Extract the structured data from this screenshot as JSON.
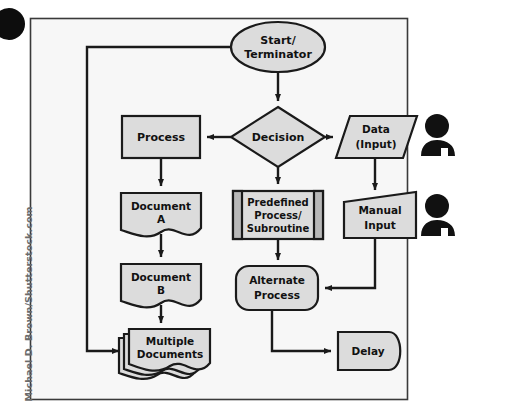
{
  "canvas": {
    "width": 528,
    "height": 417,
    "background": "#ffffff",
    "frame": {
      "x": 30,
      "y": 18,
      "width": 378,
      "height": 382,
      "stroke": "#3a3a3a",
      "fill": "#f7f7f7"
    }
  },
  "palette": {
    "shape_fill": "#dcdcdc",
    "shape_stroke": "#1a1a1a",
    "predefined_bar_fill": "#b8b8b8",
    "connector": "#1a1a1a",
    "person_icon": "#111111",
    "text": "#111111",
    "watermark_text": "#6b6b6b",
    "corner_dot": "#0d0d0d"
  },
  "diagram": {
    "type": "flowchart",
    "nodes": [
      {
        "id": "start",
        "name": "start-terminator-node",
        "shape": "ellipse",
        "label": "Start/\nTerminator",
        "lines": [
          "Start/",
          "Terminator"
        ],
        "cx": 278,
        "cy": 47,
        "rx": 47,
        "ry": 25
      },
      {
        "id": "decision",
        "name": "decision-node",
        "shape": "diamond",
        "label": "Decision",
        "lines": [
          "Decision"
        ],
        "cx": 278,
        "cy": 137,
        "rx": 47,
        "ry": 30
      },
      {
        "id": "process",
        "name": "process-node",
        "shape": "rectangle",
        "label": "Process",
        "lines": [
          "Process"
        ],
        "x": 122,
        "y": 116,
        "width": 78,
        "height": 42
      },
      {
        "id": "data",
        "name": "data-input-node",
        "shape": "parallelogram",
        "label": "Data\n(Input)",
        "lines": [
          "Data",
          "(Input)"
        ],
        "x": 337,
        "y": 116,
        "width": 76,
        "height": 42
      },
      {
        "id": "docA",
        "name": "document-a-node",
        "shape": "document",
        "label": "Document\nA",
        "lines": [
          "Document",
          "A"
        ],
        "x": 121,
        "y": 193,
        "width": 80,
        "height": 46
      },
      {
        "id": "predefined",
        "name": "predefined-process-node",
        "shape": "predefined-process",
        "label": "Predefined\nProcess/\nSubroutine",
        "lines": [
          "Predefined",
          "Process/",
          "Subroutine"
        ],
        "x": 233,
        "y": 191,
        "width": 90,
        "height": 48
      },
      {
        "id": "manual",
        "name": "manual-input-node",
        "shape": "manual-input",
        "label": "Manual\nInput",
        "lines": [
          "Manual",
          "Input"
        ],
        "x": 344,
        "y": 196,
        "width": 72,
        "height": 42
      },
      {
        "id": "docB",
        "name": "document-b-node",
        "shape": "document",
        "label": "Document\nB",
        "lines": [
          "Document",
          "B"
        ],
        "x": 121,
        "y": 264,
        "width": 80,
        "height": 46
      },
      {
        "id": "alternate",
        "name": "alternate-process-node",
        "shape": "rounded-rectangle",
        "label": "Alternate\nProcess",
        "lines": [
          "Alternate",
          "Process"
        ],
        "x": 236,
        "y": 266,
        "width": 82,
        "height": 44
      },
      {
        "id": "multidocs",
        "name": "multiple-documents-node",
        "shape": "multi-document",
        "label": "Multiple\nDocuments",
        "lines": [
          "Multiple",
          "Documents"
        ],
        "x": 128,
        "y": 329,
        "width": 82,
        "height": 44
      },
      {
        "id": "delay",
        "name": "delay-node",
        "shape": "delay",
        "label": "Delay",
        "lines": [
          "Delay"
        ],
        "x": 338,
        "y": 332,
        "width": 70,
        "height": 38
      }
    ],
    "person_icons": [
      {
        "id": "person1",
        "name": "person-icon-data-input",
        "cx": 438,
        "cy": 135
      },
      {
        "id": "person2",
        "name": "person-icon-manual-input",
        "cx": 438,
        "cy": 215
      }
    ],
    "connectors": [
      {
        "id": "c1",
        "name": "connector-start-to-decision",
        "from": "start",
        "to": "decision",
        "arrow": true
      },
      {
        "id": "c2",
        "name": "connector-decision-to-process",
        "from": "decision",
        "to": "process",
        "arrow": true
      },
      {
        "id": "c3",
        "name": "connector-decision-to-data",
        "from": "decision",
        "to": "data",
        "arrow": true
      },
      {
        "id": "c4",
        "name": "connector-decision-to-predefined",
        "from": "decision",
        "to": "predefined",
        "arrow": true
      },
      {
        "id": "c5",
        "name": "connector-process-to-document-a",
        "from": "process",
        "to": "docA",
        "arrow": true
      },
      {
        "id": "c6",
        "name": "connector-document-a-to-document-b",
        "from": "docA",
        "to": "docB",
        "arrow": true
      },
      {
        "id": "c7",
        "name": "connector-document-b-to-multiple-docs",
        "from": "docB",
        "to": "multidocs",
        "arrow": true
      },
      {
        "id": "c8",
        "name": "connector-data-to-manual-input",
        "from": "data",
        "to": "manual",
        "arrow": true
      },
      {
        "id": "c9",
        "name": "connector-predefined-to-alternate",
        "from": "predefined",
        "to": "alternate",
        "arrow": true
      },
      {
        "id": "c10",
        "name": "connector-manual-input-to-alternate",
        "from": "manual",
        "to": "alternate",
        "arrow": true
      },
      {
        "id": "c11",
        "name": "connector-alternate-to-delay",
        "from": "alternate",
        "to": "delay",
        "arrow": true
      },
      {
        "id": "c12",
        "name": "connector-start-loop-to-multiple-docs",
        "from": "start",
        "to": "multidocs",
        "arrow": true
      }
    ]
  },
  "watermark": {
    "text": "Michael D. Brown/Shutterstock.com"
  }
}
